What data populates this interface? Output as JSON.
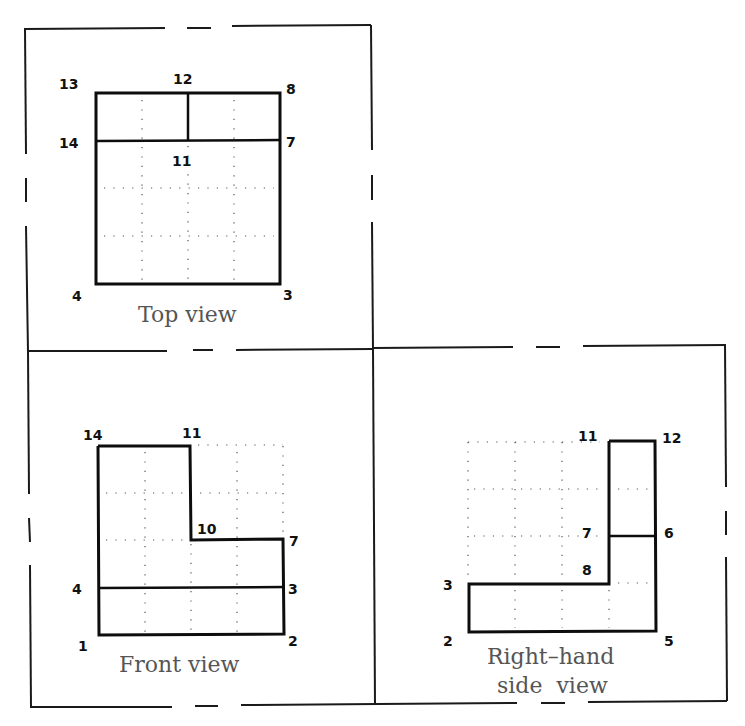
{
  "diagram": {
    "colors": {
      "line": "#0d0d0d",
      "caption": "#555555",
      "grid": "#555555",
      "background": "#ffffff"
    },
    "views": {
      "top": {
        "caption": "Top view",
        "points": {
          "13": "13",
          "12": "12",
          "8": "8",
          "14": "14",
          "11": "11",
          "7": "7",
          "4": "4",
          "3": "3"
        }
      },
      "front": {
        "caption": "Front view",
        "points": {
          "14": "14",
          "11": "11",
          "10": "10",
          "7": "7",
          "4": "4",
          "3": "3",
          "1": "1",
          "2": "2"
        }
      },
      "side": {
        "caption_line1": "Right–hand",
        "caption_line2": "side  view",
        "points": {
          "11": "11",
          "12": "12",
          "7": "7",
          "6": "6",
          "8": "8",
          "3": "3",
          "2": "2",
          "5": "5"
        }
      }
    }
  }
}
